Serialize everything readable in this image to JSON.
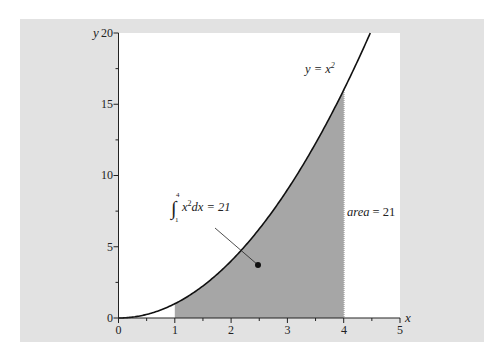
{
  "chart_data": {
    "type": "area",
    "title": "",
    "xlabel": "x",
    "ylabel": "y",
    "xlim": [
      0,
      5
    ],
    "ylim": [
      0,
      20
    ],
    "x_ticks": [
      0,
      1,
      2,
      3,
      4,
      5
    ],
    "y_ticks": [
      0,
      5,
      10,
      15,
      20
    ],
    "x_minor_step": 0.5,
    "y_minor_step": 2.5,
    "grid": false,
    "series": [
      {
        "name": "y = x^2",
        "function": "x^2",
        "x": [
          0,
          0.5,
          1,
          1.5,
          2,
          2.5,
          3,
          3.5,
          4,
          4.5
        ],
        "values": [
          0,
          0.25,
          1,
          2.25,
          4,
          6.25,
          9,
          12.25,
          16,
          20.25
        ]
      }
    ],
    "shaded_region": {
      "from_x": 1,
      "to_x": 4,
      "under": "y = x^2",
      "color": "#a6a6a6"
    },
    "annotations": [
      {
        "text": "y = x²",
        "x": 3.55,
        "y": 17.3
      },
      {
        "text": "∫₁⁴ x²dx = 21",
        "x": 1.0,
        "y": 7.5,
        "pointer_to": [
          2.5,
          3.7
        ]
      },
      {
        "text": "area = 21",
        "x": 4.4,
        "y": 7.6
      }
    ]
  },
  "labels": {
    "x_axis": "x",
    "y_axis": "y",
    "curve": "y = x",
    "curve_sup": "2",
    "integral_upper": "4",
    "integral_lower": "1",
    "integral_expr": "x",
    "integral_sup": "2",
    "integral_rest": "dx = 21",
    "area_word": "area",
    "area_rest": " = 21",
    "x_ticks": [
      "0",
      "1",
      "2",
      "3",
      "4",
      "5"
    ],
    "y_ticks": [
      "0",
      "5",
      "10",
      "15",
      "20"
    ]
  },
  "colors": {
    "panel": "#e2e2e2",
    "plot_bg": "#ffffff",
    "shade": "#a6a6a6",
    "curve": "#111111"
  }
}
